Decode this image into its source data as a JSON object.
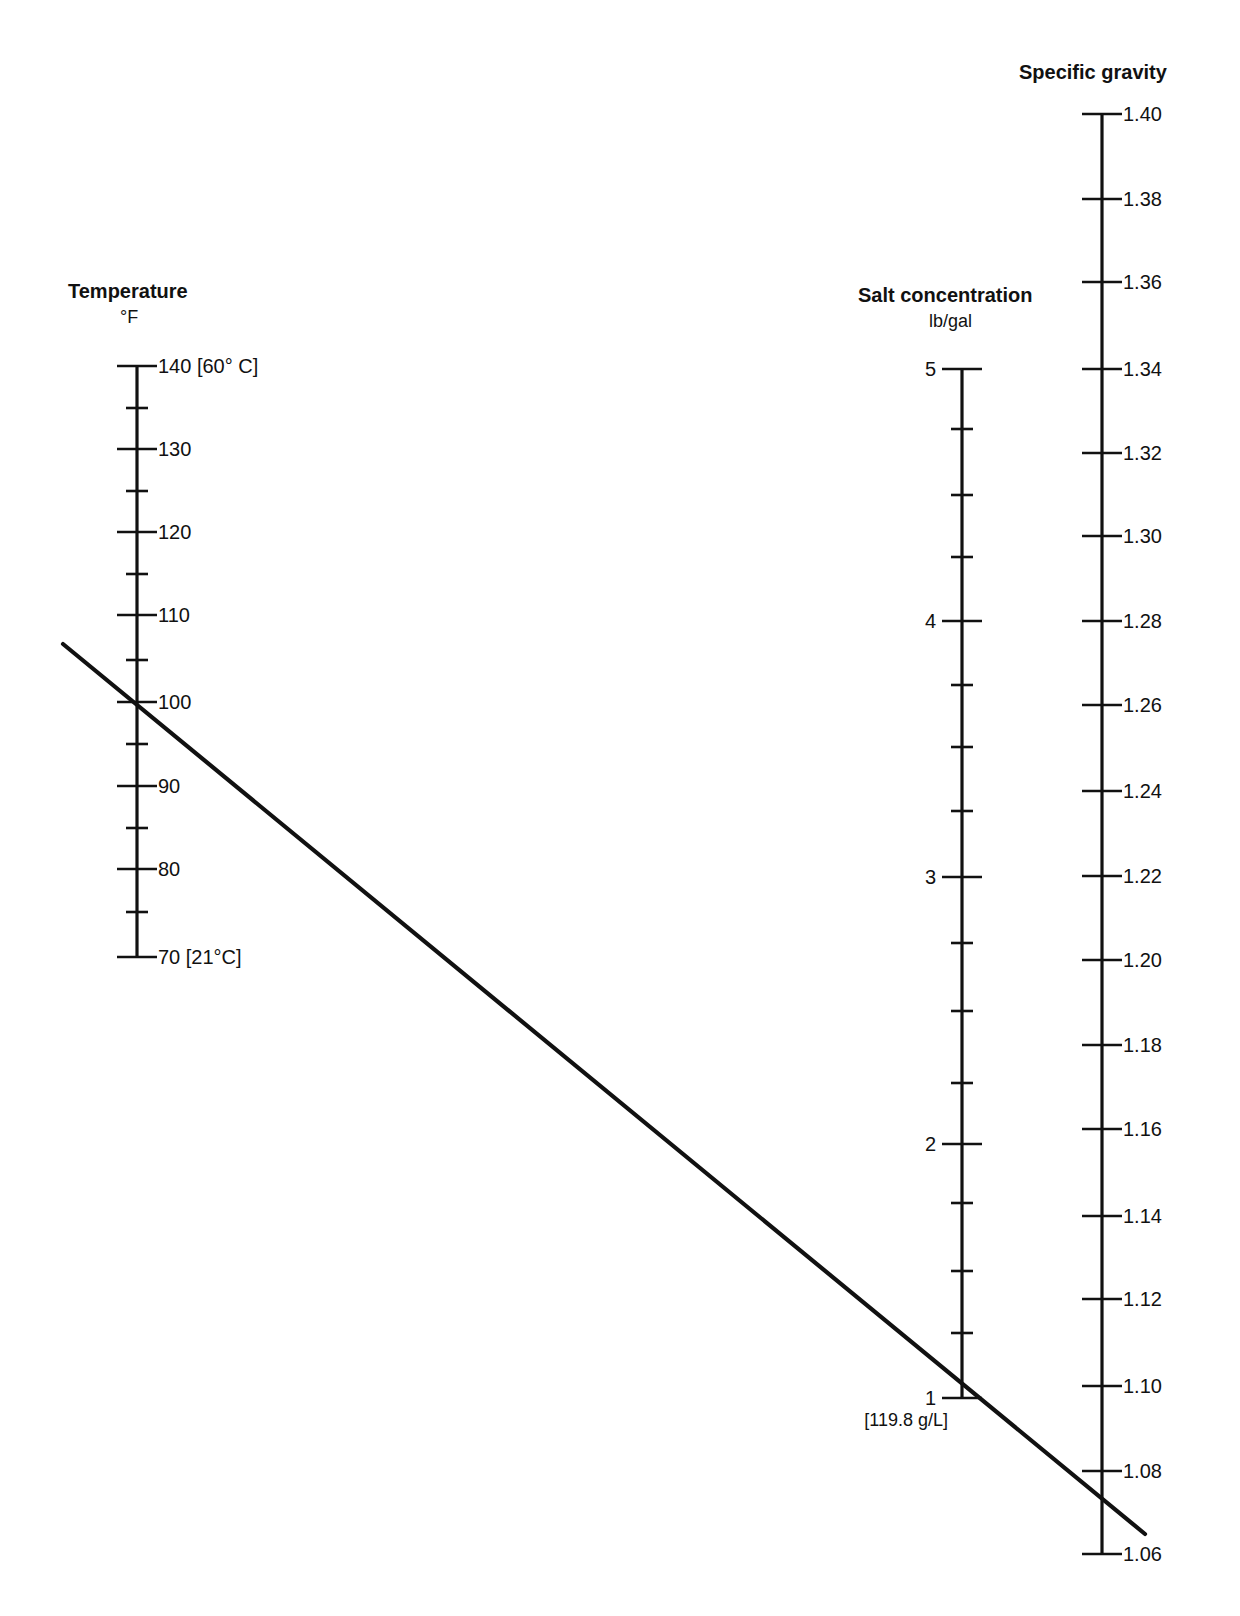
{
  "chart_data": {
    "type": "nomogram",
    "title": "",
    "axes": [
      {
        "id": "temperature",
        "title": "Temperature",
        "unit": "°F",
        "x": 137,
        "top_cap": true,
        "bottom_cap": true,
        "label_side": "right",
        "major_ticks": [
          {
            "value": 140,
            "label": "140 [60° C]",
            "y": 366
          },
          {
            "value": 130,
            "label": "130",
            "y": 449
          },
          {
            "value": 120,
            "label": "120",
            "y": 532
          },
          {
            "value": 110,
            "label": "110",
            "y": 615
          },
          {
            "value": 100,
            "label": "100",
            "y": 702
          },
          {
            "value": 90,
            "label": "90",
            "y": 786
          },
          {
            "value": 80,
            "label": "80",
            "y": 869
          },
          {
            "value": 70,
            "label": "70 [21°C]",
            "y": 957
          }
        ],
        "minor_ticks_y": [
          408,
          491,
          574,
          660,
          744,
          828,
          912
        ],
        "range": [
          70,
          140
        ]
      },
      {
        "id": "salt_concentration",
        "title": "Salt concentration",
        "unit": "lb/gal",
        "x": 962,
        "top_cap": true,
        "bottom_cap": true,
        "label_side": "left",
        "major_ticks": [
          {
            "value": 5,
            "label": "5",
            "y": 369
          },
          {
            "value": 4,
            "label": "4",
            "y": 621
          },
          {
            "value": 3,
            "label": "3",
            "y": 877
          },
          {
            "value": 2,
            "label": "2",
            "y": 1144
          },
          {
            "value": 1,
            "label": "1",
            "y": 1398,
            "sublabel": "[119.8 g/L]"
          }
        ],
        "minor_ticks_y": [
          429,
          495,
          557,
          685,
          747,
          811,
          943,
          1011,
          1083,
          1203,
          1271,
          1333
        ],
        "range": [
          1,
          5
        ]
      },
      {
        "id": "specific_gravity",
        "title": "Specific gravity",
        "unit": "",
        "x": 1102,
        "top_cap": true,
        "bottom_cap": true,
        "label_side": "right",
        "major_ticks": [
          {
            "value": 1.4,
            "label": "1.40",
            "y": 114
          },
          {
            "value": 1.38,
            "label": "1.38",
            "y": 199
          },
          {
            "value": 1.36,
            "label": "1.36",
            "y": 282
          },
          {
            "value": 1.34,
            "label": "1.34",
            "y": 369
          },
          {
            "value": 1.32,
            "label": "1.32",
            "y": 453
          },
          {
            "value": 1.3,
            "label": "1.30",
            "y": 536
          },
          {
            "value": 1.28,
            "label": "1.28",
            "y": 621
          },
          {
            "value": 1.26,
            "label": "1.26",
            "y": 705
          },
          {
            "value": 1.24,
            "label": "1.24",
            "y": 791
          },
          {
            "value": 1.22,
            "label": "1.22",
            "y": 876
          },
          {
            "value": 1.2,
            "label": "1.20",
            "y": 960
          },
          {
            "value": 1.18,
            "label": "1.18",
            "y": 1045
          },
          {
            "value": 1.16,
            "label": "1.16",
            "y": 1129
          },
          {
            "value": 1.14,
            "label": "1.14",
            "y": 1216
          },
          {
            "value": 1.12,
            "label": "1.12",
            "y": 1299
          },
          {
            "value": 1.1,
            "label": "1.10",
            "y": 1386
          },
          {
            "value": 1.08,
            "label": "1.08",
            "y": 1471
          },
          {
            "value": 1.06,
            "label": "1.06",
            "y": 1554
          }
        ],
        "minor_ticks_y": [],
        "range": [
          1.06,
          1.4
        ]
      }
    ],
    "isopleth": {
      "description": "Straight reading line through Temperature 100 °F and Salt concentration ≈1 lb/gal, intersecting Specific gravity ≈1.074",
      "points": [
        [
          63,
          644
        ],
        [
          1145,
          1534
        ]
      ],
      "readings": {
        "temperature_F": 100,
        "salt_concentration_lb_per_gal": 1.05,
        "specific_gravity": 1.074
      }
    },
    "grid": false,
    "legend": null
  },
  "headers": {
    "temperature_title": "Temperature",
    "temperature_unit": "°F",
    "salt_title": "Salt concentration",
    "salt_unit": "lb/gal",
    "sg_title": "Specific gravity"
  }
}
